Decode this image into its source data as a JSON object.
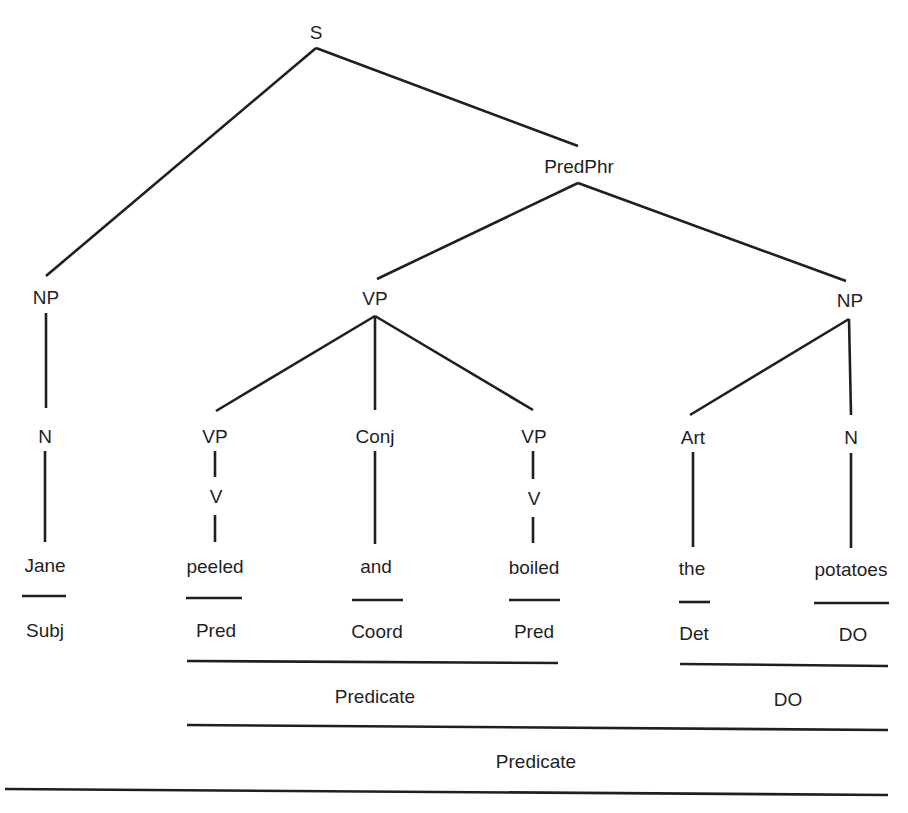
{
  "diagram": {
    "type": "syntax-tree",
    "nodes": {
      "s": "S",
      "predphr": "PredPhr",
      "np_subj": "NP",
      "vp_main": "VP",
      "np_obj": "NP",
      "n_subj": "N",
      "vp_left": "VP",
      "conj": "Conj",
      "vp_right": "VP",
      "art": "Art",
      "n_obj": "N",
      "v_left": "V",
      "v_right": "V"
    },
    "words": [
      "Jane",
      "peeled",
      "and",
      "boiled",
      "the",
      "potatoes"
    ],
    "functions": [
      "Subj",
      "Pred",
      "Coord",
      "Pred",
      "Det",
      "DO"
    ],
    "groups": {
      "predicate_inner": "Predicate",
      "do_group": "DO",
      "predicate_outer": "Predicate",
      "sentence": "Sentence"
    }
  }
}
